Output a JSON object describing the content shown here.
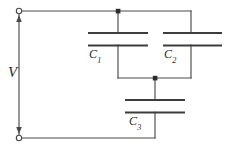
{
  "figure": {
    "background_color": "#ffffff",
    "wire_color": "#4a4a4a",
    "plate_color": "#3d3d3d",
    "node_color": "#2b2b2b"
  },
  "labels": {
    "source": {
      "name": "V",
      "symbol": "V",
      "subscript": ""
    },
    "capacitor_1": {
      "name": "C1",
      "symbol": "C",
      "subscript": "1"
    },
    "capacitor_2": {
      "name": "C2",
      "symbol": "C",
      "subscript": "2"
    },
    "capacitor_3": {
      "name": "C3",
      "symbol": "C",
      "subscript": "3"
    }
  },
  "components": [
    {
      "id": "capacitor-1",
      "label": "C1",
      "type": "capacitor",
      "orientation": "horizontal-plates",
      "plate_left_x": 88,
      "plate_right_x": 148,
      "plate_top_y": 33,
      "plate_bottom_y": 45
    },
    {
      "id": "capacitor-2",
      "label": "C2",
      "type": "capacitor",
      "orientation": "horizontal-plates",
      "plate_left_x": 163,
      "plate_right_x": 222,
      "plate_top_y": 33,
      "plate_bottom_y": 45
    },
    {
      "id": "capacitor-3",
      "label": "C3",
      "type": "capacitor",
      "orientation": "horizontal-plates",
      "plate_left_x": 125,
      "plate_right_x": 185,
      "plate_top_y": 100,
      "plate_bottom_y": 112
    },
    {
      "id": "voltage-source",
      "label": "V",
      "type": "voltage-source",
      "orientation": "vertical",
      "terminal_top": [
        19,
        11
      ],
      "terminal_bottom": [
        19,
        138
      ]
    }
  ],
  "nodes": [
    {
      "id": "node-top",
      "x": 118,
      "y": 11,
      "type": "junction-dot"
    },
    {
      "id": "node-middle",
      "x": 155,
      "y": 78,
      "type": "junction-dot"
    },
    {
      "id": "terminal-top",
      "x": 19,
      "y": 11,
      "type": "open-terminal"
    },
    {
      "id": "terminal-bottom",
      "x": 19,
      "y": 138,
      "type": "open-terminal"
    }
  ]
}
